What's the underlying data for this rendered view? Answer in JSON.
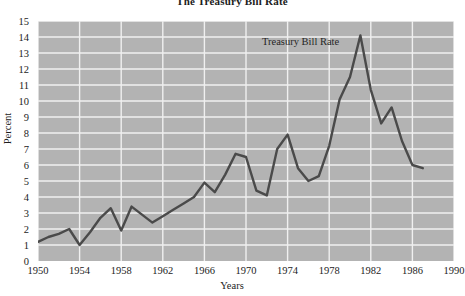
{
  "figure": {
    "title": "The Treasury Bill Rate",
    "annotation": "Treasury Bill Rate",
    "ylabel": "Percent",
    "xlabel": "Years",
    "plot_bg": "#b3b3b3",
    "grid_color": "#f0f0f0",
    "line_color": "#4a4a4a"
  },
  "chart_data": {
    "type": "line",
    "title": "The Treasury Bill Rate",
    "xlabel": "Years",
    "ylabel": "Percent",
    "xlim": [
      1950,
      1990
    ],
    "ylim": [
      0,
      15
    ],
    "xticks": [
      1950,
      1954,
      1958,
      1962,
      1966,
      1970,
      1974,
      1978,
      1982,
      1986,
      1990
    ],
    "yticks": [
      0,
      1,
      2,
      3,
      4,
      5,
      6,
      7,
      8,
      9,
      10,
      11,
      12,
      13,
      14,
      15
    ],
    "grid": true,
    "legend": "none",
    "annotations": [
      {
        "text": "Treasury Bill Rate",
        "x": 1971.5,
        "y": 13.3
      }
    ],
    "series": [
      {
        "name": "Treasury Bill Rate",
        "color": "#4a4a4a",
        "x": [
          1950,
          1951,
          1952,
          1953,
          1954,
          1955,
          1956,
          1957,
          1958,
          1959,
          1960,
          1961,
          1962,
          1963,
          1964,
          1965,
          1966,
          1967,
          1968,
          1969,
          1970,
          1971,
          1972,
          1973,
          1974,
          1975,
          1976,
          1977,
          1978,
          1979,
          1980,
          1981,
          1982,
          1983,
          1984,
          1985,
          1986,
          1987
        ],
        "y": [
          1.2,
          1.5,
          1.7,
          2.0,
          1.0,
          1.8,
          2.7,
          3.3,
          1.9,
          3.4,
          2.9,
          2.4,
          2.8,
          3.2,
          3.6,
          4.0,
          4.9,
          4.3,
          5.4,
          6.7,
          6.5,
          4.4,
          4.1,
          7.0,
          7.9,
          5.8,
          5.0,
          5.3,
          7.2,
          10.1,
          11.5,
          14.1,
          10.7,
          8.6,
          9.6,
          7.5,
          6.0,
          5.8
        ]
      }
    ]
  }
}
